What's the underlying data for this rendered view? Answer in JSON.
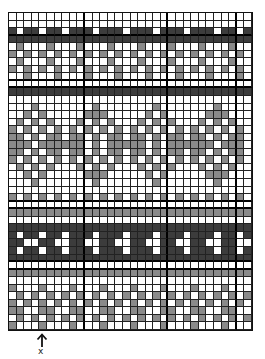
{
  "chart": {
    "columns": 32,
    "rows": 42,
    "thick_columns_after": [
      10,
      21,
      30
    ],
    "thick_rows_after": [
      3,
      9,
      10,
      25,
      26,
      33,
      34
    ],
    "legend": {
      "white": "background",
      "g": "contrast-color",
      "d": "dark-band"
    },
    "row_patterns": [
      "................................",
      "................................",
      "d.dd.dd.ddd.ddd.ddd.ddd.ddd.dd.d",
      "dddddddddddddddddddddddddddddddd",
      ".g...g...g...g...g...g...g...g..",
      "g.g.g.g.g.g.g.g.g.g.g.g.g.g.g.g.",
      ".g...g...g...g...g...g...g...g..",
      "g.g.g.g.g.g.g.g.g.g.g.g.g.g.g.g.",
      "..g...g...g...g...g...g...g...g.",
      "................................",
      "dddddddddddddddddddddddddddddddd",
      "................................",
      "...g.......g.......g.......g....",
      "..g.g.....ggg.....g.g.....ggg...",
      ".g.g.g...g.g.g...g.g.g...g.g.g..",
      "g.g.g.g.g.g.g.g.g.g.g.g.g.g.g.g.",
      "gg.g.gg.gg.g.gg.gg.g.gg.gg.g.gg.",
      "ggg.gggggg.g.ggggg.g.gggggg.ggg.",
      "gg.g.gg.gg.g.gg.gg.g.gg.gg.g.gg.",
      "g.g.g.g.g.g.g.g.g.g.g.g.g.g.g.g.",
      ".g.g.g...g.g.g...g.g.g...g.g.g..",
      "..g.g.....ggg.....g.g.....ggg...",
      "...g.......g.......g.......g....",
      "................................",
      "g.g.g.g.g.g.g.g.g.g.g.g.g.g.g.g.",
      "................................",
      "gggggggggggggggggggggggggggggggg",
      "................................",
      "dddddddddddddddddddddddddddddddd",
      "d.dd.dd.ddd.ddd.ddd.ddd.ddd.dd.d",
      "dd..dd..dd..dd..dd..dd..dd..dd..",
      "d.dd.dd.ddd.ddd.ddd.ddd.ddd.dd.d",
      "dddddddddddddddddddddddddddddddd",
      "................................",
      "gggggggggggggggggggggggggggggggg",
      "................................",
      "g...g...g...g...g...g...g...g...",
      ".g.g.g.g.g.g.g.g.g.g.g.g.g.g.g.g",
      "g.g.g.g.g.g.g.g.g.g.g.g.g.g.g.g.",
      "gg..gg..gg..gg..gg..gg..gg..gg..",
      ".g.g.g.g.g.g.g.g.g.g.g.g.g.g.g.g",
      "g...g...g...g...g...g...g...g..."
    ]
  },
  "marker": {
    "arrow_icon": "up-arrow",
    "label": "x"
  }
}
